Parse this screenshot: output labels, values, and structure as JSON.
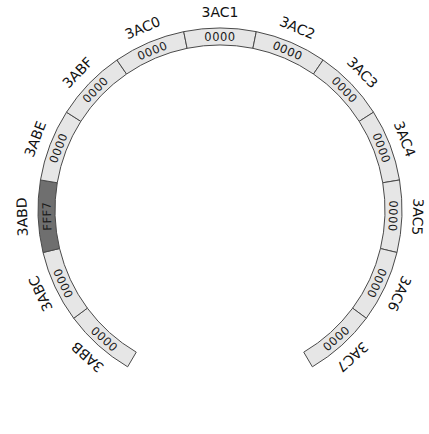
{
  "diagram": {
    "type": "circular-memory-ring",
    "geometry": {
      "cx": 220,
      "cy": 210,
      "outer_radius": 182,
      "inner_radius": 165,
      "label_radius": 193,
      "value_radius": 169,
      "segment_degrees": 23,
      "center_index": 6
    },
    "colors": {
      "normal_fill": "#e6e6e6",
      "highlight_fill": "#6f6f6f",
      "stroke": "#4a4a4a",
      "text": "#111111"
    },
    "segments": [
      {
        "address": "3ABB",
        "value": "0000",
        "highlight": false
      },
      {
        "address": "3ABC",
        "value": "0000",
        "highlight": false
      },
      {
        "address": "3ABD",
        "value": "FFF7",
        "highlight": true
      },
      {
        "address": "3ABE",
        "value": "0000",
        "highlight": false
      },
      {
        "address": "3ABF",
        "value": "0000",
        "highlight": false
      },
      {
        "address": "3AC0",
        "value": "0000",
        "highlight": false
      },
      {
        "address": "3AC1",
        "value": "0000",
        "highlight": false
      },
      {
        "address": "3AC2",
        "value": "0000",
        "highlight": false
      },
      {
        "address": "3AC3",
        "value": "0000",
        "highlight": false
      },
      {
        "address": "3AC4",
        "value": "0000",
        "highlight": false
      },
      {
        "address": "3AC5",
        "value": "0000",
        "highlight": false
      },
      {
        "address": "3AC6",
        "value": "0000",
        "highlight": false
      },
      {
        "address": "3AC7",
        "value": "0000",
        "highlight": false
      }
    ]
  }
}
